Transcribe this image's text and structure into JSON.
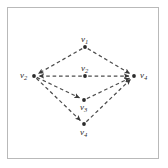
{
  "figure": {
    "type": "directed-graph-diagram",
    "background_color": "#ffffff",
    "border_color": "#b9b9b9",
    "edge_color": "#4d4d4d",
    "edge_style": "dashed",
    "node_color": "#2b2b2b"
  },
  "nodes": [
    {
      "id": "top",
      "label_text": "v",
      "label_sub": "1",
      "x": 85,
      "y": 47,
      "label_x": 81,
      "label_y": 35
    },
    {
      "id": "center",
      "label_text": "v",
      "label_sub": "2",
      "x": 85,
      "y": 76,
      "label_x": 81,
      "label_y": 64
    },
    {
      "id": "left",
      "label_text": "v",
      "label_sub": "2",
      "x": 34,
      "y": 76,
      "label_x": 20,
      "label_y": 71
    },
    {
      "id": "right",
      "label_text": "v",
      "label_sub": "4",
      "x": 134,
      "y": 76,
      "label_x": 140,
      "label_y": 71
    },
    {
      "id": "mid",
      "label_text": "v",
      "label_sub": "3",
      "x": 84,
      "y": 100,
      "label_x": 80,
      "label_y": 103
    },
    {
      "id": "bottom",
      "label_text": "v",
      "label_sub": "4",
      "x": 84,
      "y": 124,
      "label_x": 80,
      "label_y": 128
    }
  ],
  "edges": [
    {
      "from": "top",
      "to": "left",
      "arrow": true
    },
    {
      "from": "top",
      "to": "right",
      "arrow": true
    },
    {
      "from": "center",
      "to": "left",
      "arrow": true
    },
    {
      "from": "center",
      "to": "right",
      "arrow": true
    },
    {
      "from": "left",
      "to": "mid",
      "arrow": true
    },
    {
      "from": "left",
      "to": "bottom",
      "arrow": true
    },
    {
      "from": "mid",
      "to": "right",
      "arrow": true
    },
    {
      "from": "bottom",
      "to": "right",
      "arrow": true
    }
  ]
}
